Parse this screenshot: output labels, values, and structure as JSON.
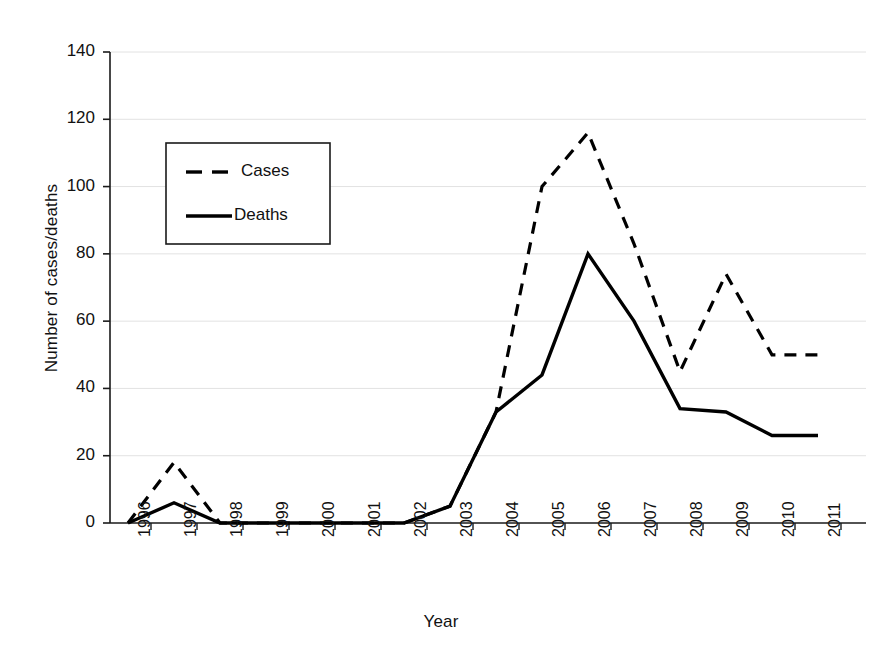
{
  "chart_data": {
    "type": "line",
    "title": "",
    "xlabel": "Year",
    "ylabel": "Number of cases/deaths",
    "categories": [
      "1996",
      "1997",
      "1998",
      "1999",
      "2000",
      "2001",
      "2002",
      "2003",
      "2004",
      "2005",
      "2006",
      "2007",
      "2008",
      "2009",
      "2010",
      "2011"
    ],
    "x": [
      1996,
      1997,
      1998,
      1999,
      2000,
      2001,
      2002,
      2003,
      2004,
      2005,
      2006,
      2007,
      2008,
      2009,
      2010,
      2011
    ],
    "ylim": [
      0,
      140
    ],
    "yticks": [
      0,
      20,
      40,
      60,
      80,
      100,
      120,
      140
    ],
    "grid": "horizontal",
    "legend_position": "upper-left-inside",
    "series": [
      {
        "name": "Cases",
        "style": "dashed",
        "color": "#000000",
        "values": [
          0,
          18,
          0,
          0,
          0,
          0,
          0,
          5,
          33,
          100,
          116,
          83,
          45,
          74,
          50,
          50
        ]
      },
      {
        "name": "Deaths",
        "style": "solid",
        "color": "#000000",
        "values": [
          0,
          6,
          0,
          0,
          0,
          0,
          0,
          5,
          33,
          44,
          80,
          60,
          34,
          33,
          26,
          26
        ]
      }
    ]
  },
  "axes": {
    "y_tick_labels": [
      "140",
      "120",
      "100",
      "80",
      "60",
      "40",
      "20",
      "0"
    ],
    "x_tick_labels": [
      "1996",
      "1997",
      "1998",
      "1999",
      "2000",
      "2001",
      "2002",
      "2003",
      "2004",
      "2005",
      "2006",
      "2007",
      "2008",
      "2009",
      "2010",
      "2011"
    ],
    "y_axis_title": "Number of cases/deaths",
    "x_axis_title": "Year"
  },
  "legend": {
    "items": [
      {
        "label": "Cases",
        "style": "dashed"
      },
      {
        "label": "Deaths",
        "style": "solid"
      }
    ]
  },
  "colors": {
    "ink": "#000000",
    "gridline": "#e2e2e2",
    "background": "#ffffff"
  }
}
